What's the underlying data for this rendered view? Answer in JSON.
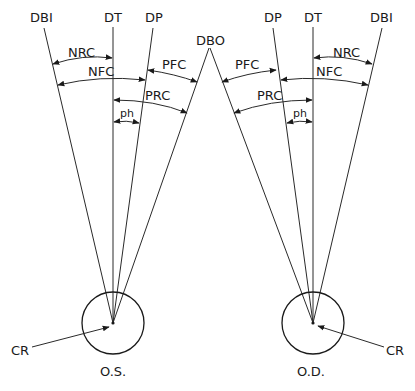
{
  "diagram": {
    "labels": {
      "dbi": "DBI",
      "dt": "DT",
      "dp": "DP",
      "dbo": "DBO",
      "nrc": "NRC",
      "nfc": "NFC",
      "pfc": "PFC",
      "prc": "PRC",
      "ph": "ph",
      "cr": "CR"
    },
    "left_eye": {
      "label": "O.S."
    },
    "right_eye": {
      "label": "O.D."
    },
    "colors": {
      "stroke": "#2a2a2a",
      "background": "#ffffff"
    }
  }
}
